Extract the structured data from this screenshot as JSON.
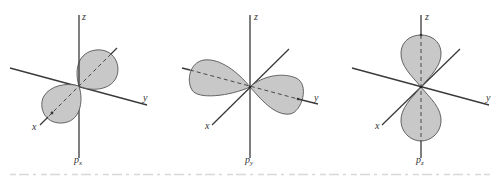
{
  "figure": {
    "panels": [
      {
        "id": "px",
        "orbital_label": "p",
        "orbital_subscript": "x",
        "axis_labels": {
          "z": "z",
          "y": "y",
          "x": "x"
        },
        "lobe_orientation": "along x-axis"
      },
      {
        "id": "py",
        "orbital_label": "p",
        "orbital_subscript": "y",
        "axis_labels": {
          "z": "z",
          "y": "y",
          "x": "x"
        },
        "lobe_orientation": "along y-axis"
      },
      {
        "id": "pz",
        "orbital_label": "p",
        "orbital_subscript": "z",
        "axis_labels": {
          "z": "z",
          "y": "y",
          "x": "x"
        },
        "lobe_orientation": "along z-axis"
      }
    ],
    "colors": {
      "lobe_fill": "#c8c8c8",
      "lobe_stroke": "#555555",
      "axis": "#3a3a3a",
      "background": "#ffffff"
    }
  }
}
